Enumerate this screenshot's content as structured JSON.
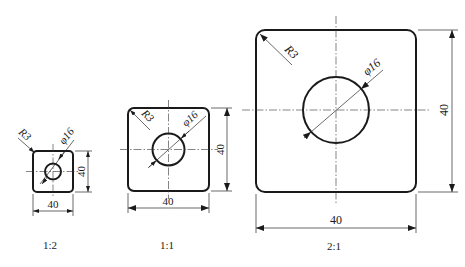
{
  "figure": {
    "views": [
      {
        "scale_label": "1:2",
        "width_dim": "40",
        "height_dim": "40",
        "hole_dim": "φ16",
        "corner_radius_dim": "R3"
      },
      {
        "scale_label": "1:1",
        "width_dim": "40",
        "height_dim": "40",
        "hole_dim": "φ16",
        "corner_radius_dim": "R3"
      },
      {
        "scale_label": "2:1",
        "width_dim": "40",
        "height_dim": "40",
        "hole_dim": "φ16",
        "corner_radius_dim": "R3"
      }
    ]
  }
}
